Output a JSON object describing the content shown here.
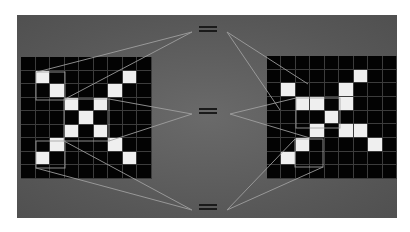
{
  "diagram": {
    "symbol": "=",
    "colors": {
      "background": "#ffffff",
      "panel": "#5a5a5a",
      "cell_off": "#030303",
      "cell_on": "#efefef",
      "grid_lines": "#3c3c3c",
      "connector_lines": "#9a9a9a",
      "equals": "#1a1a1a"
    },
    "grid_size": [
      9,
      9
    ],
    "left_grid": {
      "label": "original X",
      "on_cells": [
        [
          1,
          1
        ],
        [
          1,
          7
        ],
        [
          2,
          2
        ],
        [
          2,
          6
        ],
        [
          3,
          3
        ],
        [
          3,
          5
        ],
        [
          4,
          4
        ],
        [
          5,
          3
        ],
        [
          5,
          5
        ],
        [
          6,
          2
        ],
        [
          6,
          6
        ],
        [
          7,
          1
        ],
        [
          7,
          7
        ]
      ]
    },
    "right_grid": {
      "label": "shifted/distorted X",
      "on_cells": [
        [
          1,
          6
        ],
        [
          2,
          1
        ],
        [
          2,
          5
        ],
        [
          3,
          2
        ],
        [
          3,
          3
        ],
        [
          3,
          5
        ],
        [
          4,
          4
        ],
        [
          5,
          3
        ],
        [
          5,
          5
        ],
        [
          5,
          6
        ],
        [
          6,
          2
        ],
        [
          6,
          7
        ],
        [
          7,
          1
        ]
      ]
    },
    "equals_symbols": [
      {
        "id": "top",
        "x": 199,
        "y": 26
      },
      {
        "id": "middle",
        "x": 199,
        "y": 108
      },
      {
        "id": "bottom",
        "x": 199,
        "y": 204
      }
    ],
    "connections": [
      {
        "from": "left_grid",
        "to": "top",
        "patch": "top-left diagonal"
      },
      {
        "from": "left_grid",
        "to": "middle",
        "patch": "center"
      },
      {
        "from": "left_grid",
        "to": "bottom",
        "patch": "bottom-left diagonal"
      },
      {
        "from": "right_grid",
        "to": "top",
        "patch": "top-left diagonal"
      },
      {
        "from": "right_grid",
        "to": "middle",
        "patch": "center"
      },
      {
        "from": "right_grid",
        "to": "bottom",
        "patch": "bottom-left diagonal"
      }
    ]
  }
}
